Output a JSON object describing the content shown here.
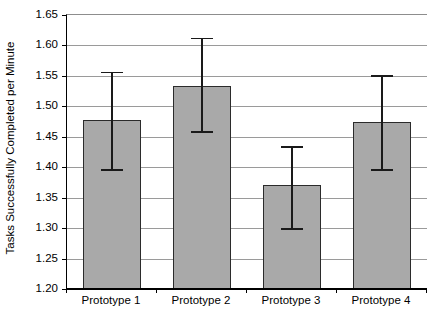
{
  "chart_data": {
    "type": "bar",
    "title": "",
    "subtitle": "",
    "xlabel": "",
    "ylabel": "Tasks Successfully Completed per Minute",
    "categories": [
      "Prototype 1",
      "Prototype 2",
      "Prototype 3",
      "Prototype 4"
    ],
    "values": [
      1.477,
      1.534,
      1.37,
      1.475
    ],
    "error_upper": [
      1.557,
      1.613,
      1.435,
      1.551
    ],
    "error_lower": [
      1.397,
      1.459,
      1.3,
      1.397
    ],
    "error_margins": [
      0.08,
      0.079,
      0.065,
      0.078
    ],
    "ylim": [
      1.2,
      1.65
    ],
    "ytick_step": 0.05,
    "ytick_labels": [
      "1.65",
      "1.60",
      "1.55",
      "1.50",
      "1.45",
      "1.40",
      "1.35",
      "1.30",
      "1.25",
      "1.20"
    ],
    "ytick_values": [
      1.65,
      1.6,
      1.55,
      1.5,
      1.45,
      1.4,
      1.35,
      1.3,
      1.25,
      1.2
    ],
    "grid": "horizontal",
    "legend": "none",
    "series": [
      {
        "name": "Tasks Successfully Completed per Minute",
        "values": [
          1.477,
          1.534,
          1.37,
          1.475
        ]
      }
    ],
    "colors": {
      "bar_fill": "#a9a9a9",
      "bar_border": "#2b2b2b",
      "gridline": "#9a9a9a",
      "axis": "#000000",
      "error_bar": "#1a1a1a",
      "background": "#ffffff",
      "text": "#000000"
    }
  }
}
